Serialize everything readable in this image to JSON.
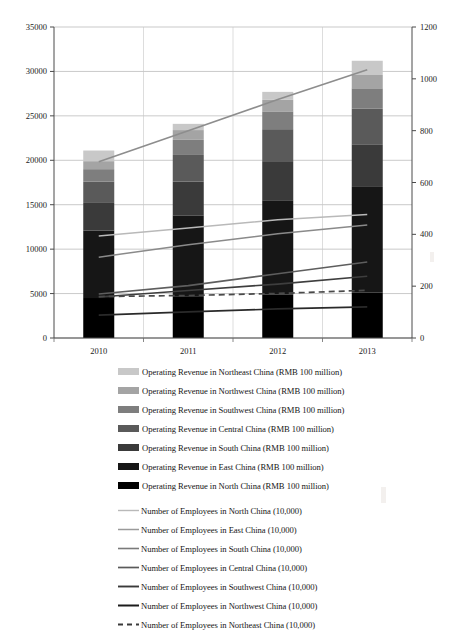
{
  "chart_data": {
    "type": "bar",
    "title": "",
    "subtitle": "",
    "xlabel": "",
    "ylabel": "",
    "categories": [
      "2010",
      "2011",
      "2012",
      "2013"
    ],
    "grid": true,
    "legend_position": "bottom",
    "left_axis": {
      "label": "Operating Revenue (RMB 100 million)",
      "min": 0,
      "max": 35000,
      "step": 5000,
      "ticks": [
        "0",
        "5000",
        "10000",
        "15000",
        "20000",
        "25000",
        "30000",
        "35000"
      ],
      "tick_values": [
        0,
        5000,
        10000,
        15000,
        20000,
        25000,
        30000,
        35000
      ]
    },
    "right_axis": {
      "label": "Number of Employees (10,000)",
      "min": 0,
      "max": 1200,
      "step": 200,
      "ticks": [
        "0",
        "200",
        "400",
        "600",
        "800",
        "1000",
        "1200"
      ],
      "tick_values": [
        0,
        200,
        400,
        600,
        800,
        1000,
        1200
      ]
    },
    "stacked_series": [
      {
        "name": "Operating Revenue in North China",
        "unit": "RMB 100 million",
        "color": "#000000",
        "values": [
          4500,
          4700,
          4900,
          5100
        ]
      },
      {
        "name": "Operating Revenue in East China",
        "unit": "RMB 100 million",
        "color": "#161616",
        "values": [
          7600,
          9100,
          10600,
          11900
        ]
      },
      {
        "name": "Operating Revenue in Central China",
        "unit": "RMB 100 million",
        "color": "#3a3a3a",
        "values": [
          3100,
          3800,
          4400,
          4800
        ]
      },
      {
        "name": "Operating Revenue in South China",
        "unit": "RMB 100 million",
        "color": "#5a5a5a",
        "values": [
          2400,
          3000,
          3600,
          4000
        ]
      },
      {
        "name": "Operating Revenue in Southwest China",
        "unit": "RMB 100 million",
        "color": "#7e7e7e",
        "values": [
          1400,
          1700,
          2000,
          2300
        ]
      },
      {
        "name": "Operating Revenue in Northwest China",
        "unit": "RMB 100 million",
        "color": "#a4a4a4",
        "values": [
          900,
          1100,
          1300,
          1500
        ]
      },
      {
        "name": "Operating Revenue in Northeast China",
        "unit": "RMB 100 million",
        "color": "#c8c8c8",
        "values": [
          1200,
          700,
          900,
          1600
        ]
      }
    ],
    "stack_totals": [
      21100,
      24100,
      27700,
      31200
    ],
    "line_series": [
      {
        "name": "Number of Employees in North China",
        "unit": "10,000",
        "color": "#8d8d8d",
        "width": 1.6,
        "dash": "none",
        "values": [
          680,
          800,
          920,
          1035
        ]
      },
      {
        "name": "Number of Employees in East China",
        "unit": "10,000",
        "color": "#b9b9b9",
        "width": 1.5,
        "dash": "none",
        "values": [
          394,
          424,
          456,
          477
        ]
      },
      {
        "name": "Number of Employees in South China",
        "unit": "10,000",
        "color": "#8a8a8a",
        "width": 1.5,
        "dash": "none",
        "values": [
          312,
          360,
          402,
          436
        ]
      },
      {
        "name": "Number of Employees in Central China",
        "unit": "10,000",
        "color": "#5e5e5e",
        "width": 1.6,
        "dash": "none",
        "values": [
          170,
          202,
          248,
          293
        ]
      },
      {
        "name": "Number of Employees in Southwest China",
        "unit": "10,000",
        "color": "#3e3e3e",
        "width": 1.6,
        "dash": "none",
        "values": [
          158,
          183,
          208,
          238
        ]
      },
      {
        "name": "Number of Employees in Northwest China",
        "unit": "10,000",
        "color": "#2a2a2a",
        "width": 1.7,
        "dash": "none",
        "values": [
          88,
          101,
          112,
          120
        ]
      },
      {
        "name": "Number of Employees in Northeast China",
        "unit": "10,000",
        "color": "#4a4a4a",
        "width": 1.7,
        "dash": "6 4",
        "values": [
          160,
          164,
          172,
          184
        ]
      }
    ],
    "legend": [
      {
        "kind": "swatch",
        "color": "#c8c8c8",
        "text": "Operating Revenue in Northeast China  (RMB 100 million)"
      },
      {
        "kind": "swatch",
        "color": "#a4a4a4",
        "text": "Operating Revenue in Northwest China  (RMB 100 million)"
      },
      {
        "kind": "swatch",
        "color": "#7e7e7e",
        "text": "Operating Revenue in Southwest China  (RMB 100 million)"
      },
      {
        "kind": "swatch",
        "color": "#5a5a5a",
        "text": "Operating Revenue in Central China  (RMB 100 million)"
      },
      {
        "kind": "swatch",
        "color": "#3a3a3a",
        "text": "Operating Revenue in South China  (RMB 100 million)"
      },
      {
        "kind": "swatch",
        "color": "#161616",
        "text": "Operating Revenue in East China  (RMB 100 million)"
      },
      {
        "kind": "swatch",
        "color": "#000000",
        "text": "Operating Revenue in North China  (RMB 100 million)"
      },
      {
        "kind": "line",
        "color": "#b9b9b9",
        "dash": "none",
        "width": 1.4,
        "text": "Number of Employees in North China  (10,000)"
      },
      {
        "kind": "line",
        "color": "#9a9a9a",
        "dash": "none",
        "width": 1.5,
        "text": "Number of Employees in East China  (10,000)"
      },
      {
        "kind": "line",
        "color": "#7a7a7a",
        "dash": "none",
        "width": 1.6,
        "text": "Number of Employees in South China  (10,000)"
      },
      {
        "kind": "line",
        "color": "#5a5a5a",
        "dash": "none",
        "width": 1.7,
        "text": "Number of Employees in Central China  (10,000)"
      },
      {
        "kind": "line",
        "color": "#3a3a3a",
        "dash": "none",
        "width": 1.9,
        "text": "Number of Employees in Southwest China  (10,000)"
      },
      {
        "kind": "line",
        "color": "#1c1c1c",
        "dash": "none",
        "width": 2.0,
        "text": "Number of Employees in Northwest China  (10,000)"
      },
      {
        "kind": "line",
        "color": "#3a3a3a",
        "dash": "5 4",
        "width": 1.8,
        "text": "Number of Employees in Northeast China  (10,000)"
      }
    ]
  }
}
